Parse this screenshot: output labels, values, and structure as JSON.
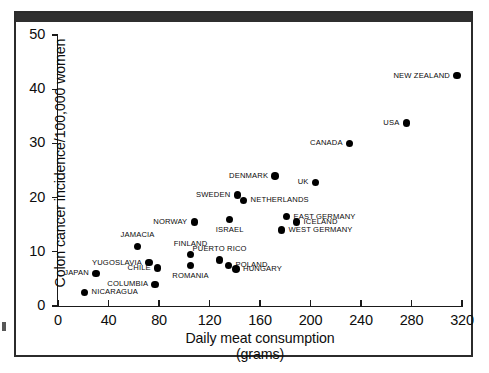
{
  "chart_data": {
    "type": "scatter",
    "title": "",
    "xlabel": "Daily meat consumption",
    "xlabel_units": "(grams)",
    "ylabel": "Colon cancer incidence/100,000 women",
    "xlim": [
      0,
      320
    ],
    "ylim": [
      0,
      50
    ],
    "xticks": [
      0,
      40,
      80,
      120,
      160,
      200,
      240,
      280,
      320
    ],
    "yticks": [
      0,
      10,
      20,
      30,
      40,
      50
    ],
    "grid": false,
    "legend": "none",
    "marker": "filled-circle",
    "marker_color": "#000000",
    "points": [
      {
        "label": "NICARAGUA",
        "x": 21,
        "y": 2.5,
        "label_pos": "right"
      },
      {
        "label": "JAPAN",
        "x": 30,
        "y": 6.0,
        "label_pos": "left"
      },
      {
        "label": "JAMACIA",
        "x": 63,
        "y": 11.0,
        "label_pos": "above"
      },
      {
        "label": "YUGOSLAVIA",
        "x": 72,
        "y": 8.0,
        "label_pos": "left"
      },
      {
        "label": "CHILE",
        "x": 79,
        "y": 7.0,
        "label_pos": "left"
      },
      {
        "label": "COLUMBIA",
        "x": 77,
        "y": 4.0,
        "label_pos": "left"
      },
      {
        "label": "NORWAY",
        "x": 108,
        "y": 15.5,
        "label_pos": "left"
      },
      {
        "label": "FINLAND",
        "x": 105,
        "y": 9.5,
        "label_pos": "above"
      },
      {
        "label": "ROMANIA",
        "x": 105,
        "y": 7.5,
        "label_pos": "below"
      },
      {
        "label": "ISRAEL",
        "x": 136,
        "y": 16.0,
        "label_pos": "below"
      },
      {
        "label": "PUERTO RICO",
        "x": 128,
        "y": 8.5,
        "label_pos": "above"
      },
      {
        "label": "POLAND",
        "x": 135,
        "y": 7.5,
        "label_pos": "right"
      },
      {
        "label": "HUNGARY",
        "x": 141,
        "y": 6.8,
        "label_pos": "right"
      },
      {
        "label": "SWEDEN",
        "x": 142,
        "y": 20.5,
        "label_pos": "left"
      },
      {
        "label": "NETHERLANDS",
        "x": 147,
        "y": 19.5,
        "label_pos": "right"
      },
      {
        "label": "DENMARK",
        "x": 172,
        "y": 24.0,
        "label_pos": "left"
      },
      {
        "label": "UK",
        "x": 204,
        "y": 22.8,
        "label_pos": "left"
      },
      {
        "label": "EAST GERMANY",
        "x": 181,
        "y": 16.5,
        "label_pos": "right"
      },
      {
        "label": "ICELAND",
        "x": 189,
        "y": 15.5,
        "label_pos": "right"
      },
      {
        "label": "WEST GERMANY",
        "x": 177,
        "y": 14.0,
        "label_pos": "right"
      },
      {
        "label": "CANADA",
        "x": 231,
        "y": 30.0,
        "label_pos": "left"
      },
      {
        "label": "USA",
        "x": 276,
        "y": 33.8,
        "label_pos": "left"
      },
      {
        "label": "NEW ZEALAND",
        "x": 316,
        "y": 42.5,
        "label_pos": "left"
      }
    ]
  },
  "axes": {
    "x_title": "Daily meat consumption",
    "x_title_units": "(grams)",
    "y_title": "Colon cancer incidence/100,000 women"
  }
}
